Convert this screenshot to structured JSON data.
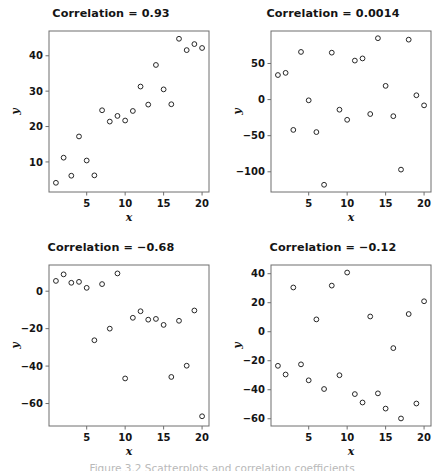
{
  "figure": {
    "background_color": "#ffffff",
    "marker_color": "#262626",
    "frame_color": "#6e6e6e",
    "caption": "Figure 3.2 Scatterplots and correlation coefficients",
    "layout": "2x2 grid of scatterplots"
  },
  "chart_data": [
    {
      "type": "scatter",
      "title": "Correlation = 0.93",
      "xlabel": "x",
      "ylabel": "y",
      "xlim": [
        0.1,
        20.9
      ],
      "ylim": [
        1.5,
        47.0
      ],
      "xticks": [
        5,
        10,
        15,
        20
      ],
      "yticks": [
        10,
        20,
        30,
        40
      ],
      "grid": false,
      "legend": false,
      "correlation": 0.93,
      "x": [
        1,
        2,
        3,
        4,
        5,
        6,
        7,
        8,
        9,
        10,
        11,
        12,
        13,
        14,
        15,
        16,
        17,
        18,
        19,
        20
      ],
      "y": [
        4.1,
        11.2,
        6.1,
        17.2,
        10.4,
        6.2,
        24.6,
        21.4,
        23.0,
        21.7,
        24.4,
        31.3,
        26.2,
        37.4,
        30.5,
        26.3,
        44.8,
        41.6,
        43.3,
        42.2
      ]
    },
    {
      "type": "scatter",
      "title": "Correlation = 0.0014",
      "xlabel": "x",
      "ylabel": "y",
      "xlim": [
        0.1,
        20.9
      ],
      "ylim": [
        -128,
        95
      ],
      "xticks": [
        5,
        10,
        15,
        20
      ],
      "yticks": [
        50,
        0,
        -50,
        -100
      ],
      "grid": false,
      "legend": false,
      "correlation": 0.0014,
      "x": [
        1,
        2,
        3,
        4,
        5,
        6,
        7,
        8,
        9,
        10,
        11,
        12,
        13,
        14,
        15,
        16,
        17,
        18,
        19,
        20
      ],
      "y": [
        34,
        37,
        -42,
        66,
        -1,
        -45,
        -118,
        65,
        -14,
        -28,
        54,
        57,
        -20,
        85,
        19,
        -23,
        -97,
        83,
        6,
        -8
      ]
    },
    {
      "type": "scatter",
      "title": "Correlation = −0.68",
      "xlabel": "x",
      "ylabel": "y",
      "xlim": [
        0.1,
        20.9
      ],
      "ylim": [
        -72,
        14
      ],
      "xticks": [
        5,
        10,
        15,
        20
      ],
      "yticks": [
        0,
        -20,
        -40,
        -60
      ],
      "grid": false,
      "legend": false,
      "correlation": -0.68,
      "x": [
        1,
        2,
        3,
        4,
        5,
        6,
        7,
        8,
        9,
        10,
        11,
        12,
        13,
        14,
        15,
        16,
        17,
        18,
        19,
        20
      ],
      "y": [
        5.5,
        9.0,
        4.5,
        5.0,
        1.8,
        -26.2,
        3.8,
        -20.0,
        9.5,
        -46.6,
        -14.2,
        -10.7,
        -15.2,
        -14.8,
        -18.0,
        -45.8,
        -15.8,
        -39.8,
        -10.3,
        -66.8
      ]
    },
    {
      "type": "scatter",
      "title": "Correlation = −0.12",
      "xlabel": "x",
      "ylabel": "y",
      "xlim": [
        0.1,
        20.9
      ],
      "ylim": [
        -65,
        46
      ],
      "xticks": [
        5,
        10,
        15,
        20
      ],
      "yticks": [
        40,
        20,
        0,
        -20,
        -40,
        -60
      ],
      "grid": false,
      "legend": false,
      "correlation": -0.12,
      "x": [
        1,
        2,
        3,
        4,
        5,
        6,
        7,
        8,
        9,
        10,
        11,
        12,
        13,
        14,
        15,
        16,
        17,
        18,
        19,
        20
      ],
      "y": [
        -23.5,
        -29.5,
        30.5,
        -22.5,
        -33.5,
        8.5,
        -39.5,
        31.8,
        -30.0,
        40.8,
        -43.0,
        -48.8,
        10.5,
        -42.5,
        -53.0,
        -11.3,
        -59.8,
        12.2,
        -49.5,
        21.0
      ]
    }
  ]
}
